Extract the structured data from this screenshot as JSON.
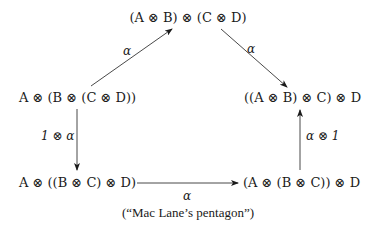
{
  "diagram": {
    "nodes": {
      "top": "(A ⊗ B) ⊗ (C ⊗ D)",
      "left": "A ⊗ (B ⊗ (C ⊗ D))",
      "right": "((A ⊗ B) ⊗ C) ⊗ D",
      "bottom_left": "A ⊗ ((B ⊗ C) ⊗ D)",
      "bottom_right": "(A ⊗ (B ⊗ C)) ⊗ D"
    },
    "edges": [
      {
        "from": "left",
        "to": "top",
        "label": "α"
      },
      {
        "from": "top",
        "to": "right",
        "label": "α"
      },
      {
        "from": "left",
        "to": "bottom_left",
        "label": "1 ⊗ α"
      },
      {
        "from": "bottom_left",
        "to": "bottom_right",
        "label": "α"
      },
      {
        "from": "bottom_right",
        "to": "right",
        "label": "α ⊗ 1"
      }
    ],
    "caption": "(“Mac Lane’s pentagon”)"
  },
  "colors": {
    "ink": "#1a1a1a",
    "background": "#ffffff"
  }
}
